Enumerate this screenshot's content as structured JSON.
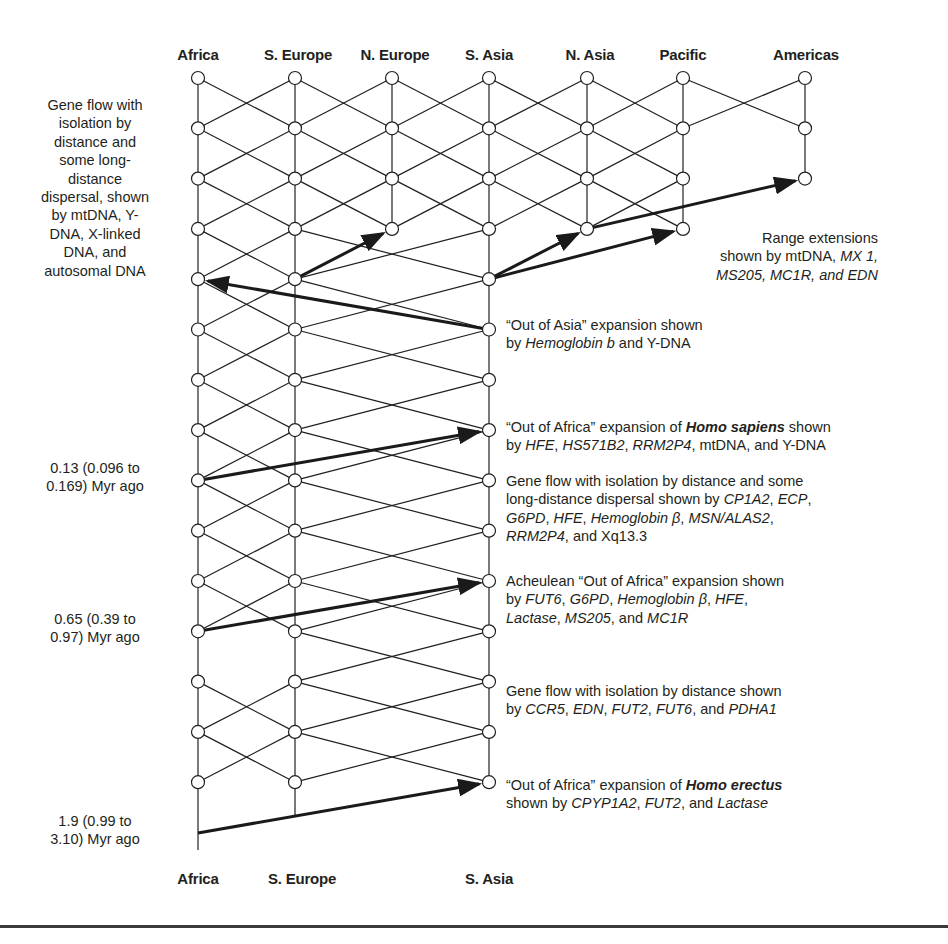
{
  "layout": {
    "columns": {
      "Africa": 198,
      "S. Europe": 295,
      "N. Europe": 392,
      "S. Asia": 489,
      "N. Asia": 587,
      "Pacific": 683,
      "Americas": 805
    },
    "row_y0": 78,
    "row_step": 50.3,
    "node_radius": 6.5,
    "line_color": "#231f20",
    "arrow_color": "#1a1a1a"
  },
  "header": {
    "regions": [
      {
        "name": "Africa",
        "x": 198
      },
      {
        "name": "S. Europe",
        "x": 298
      },
      {
        "name": "N. Europe",
        "x": 395
      },
      {
        "name": "S. Asia",
        "x": 489
      },
      {
        "name": "N. Asia",
        "x": 590
      },
      {
        "name": "Pacific",
        "x": 683
      },
      {
        "name": "Americas",
        "x": 806
      }
    ]
  },
  "footer": {
    "regions": [
      {
        "name": "Africa",
        "x": 198
      },
      {
        "name": "S. Europe",
        "x": 302
      },
      {
        "name": "S. Asia",
        "x": 489
      }
    ]
  },
  "left_notes": [
    {
      "id": "gene-flow-note",
      "top": 96,
      "lines": [
        "Gene flow with",
        "isolation by",
        "distance and",
        "some long-",
        "distance",
        "dispersal, shown",
        "by mtDNA, Y-",
        "DNA, X-linked",
        "DNA, and",
        "autosomal DNA"
      ]
    },
    {
      "id": "date-013",
      "top": 459,
      "lines": [
        "0.13 (0.096 to",
        "0.169) Myr ago"
      ]
    },
    {
      "id": "date-065",
      "top": 610,
      "lines": [
        "0.65 (0.39 to",
        "0.97) Myr ago"
      ]
    },
    {
      "id": "date-19",
      "top": 812,
      "lines": [
        "1.9 (0.99 to",
        "3.10) Myr ago"
      ]
    }
  ],
  "right_notes": [
    {
      "id": "range-extensions",
      "top": 229,
      "right": 878,
      "align": "right",
      "html_lines": [
        "Range extensions",
        "shown by mtDNA, <i>MX 1,</i>",
        "<i>MS205, MC1R, and EDN</i>"
      ]
    },
    {
      "id": "out-of-asia",
      "top": 316,
      "left": 506,
      "html_lines": [
        "“Out of Asia” expansion shown",
        "by <i>Hemoglobin b</i> and Y-DNA"
      ]
    },
    {
      "id": "out-of-africa-sapiens",
      "top": 418,
      "left": 506,
      "html_lines": [
        "“Out of Africa” expansion of <b>Homo sapiens</b> shown",
        "by <i>HFE</i>, <i>HS571B2</i>, <i>RRM2P4</i>, mtDNA, and Y-DNA"
      ]
    },
    {
      "id": "gene-flow-long-distance",
      "top": 472,
      "left": 506,
      "html_lines": [
        "Gene flow with isolation by distance and some",
        "long-distance dispersal shown by <i>CP1A2</i>, <i>ECP</i>,",
        "<i>G6PD</i>, <i>HFE</i>, <i>Hemoglobin β</i>, <i>MSN/ALAS2</i>,",
        "<i>RRM2P4</i>, and Xq13.3"
      ]
    },
    {
      "id": "acheulean",
      "top": 572,
      "left": 506,
      "html_lines": [
        "Acheulean “Out of Africa” expansion shown",
        "by <i>FUT6</i>, <i>G6PD</i>, <i>Hemoglobin β</i>, <i>HFE</i>,",
        "<i>Lactase</i>, <i>MS205</i>, and <i>MC1R</i>"
      ]
    },
    {
      "id": "gene-flow-isolation",
      "top": 682,
      "left": 506,
      "html_lines": [
        "Gene flow with isolation by distance shown",
        "by <i>CCR5</i>, <i>EDN</i>, <i>FUT2</i>, <i>FUT6</i>, and <i>PDHA1</i>"
      ]
    },
    {
      "id": "out-of-africa-erectus",
      "top": 776,
      "left": 506,
      "html_lines": [
        "“Out of Africa” expansion of <b>Homo erectus</b>",
        "shown by <i>CPYP1A2</i>, <i>FUT2</i>, and <i>Lactase</i>"
      ]
    }
  ],
  "chart_data": {
    "type": "network-diagram",
    "title": "",
    "regions": [
      "Africa",
      "S. Europe",
      "N. Europe",
      "S. Asia",
      "N. Asia",
      "Pacific",
      "Americas"
    ],
    "time_axis": "top = present, bottom = past",
    "nodes": {
      "Africa": [
        0,
        1,
        2,
        3,
        4,
        5,
        6,
        7,
        8,
        9,
        10,
        11,
        12,
        13,
        14
      ],
      "S. Europe": [
        0,
        1,
        2,
        3,
        4,
        5,
        6,
        7,
        8,
        9,
        10,
        11,
        12,
        13,
        14
      ],
      "N. Europe": [
        0,
        1,
        2,
        3
      ],
      "S. Asia": [
        0,
        1,
        2,
        3,
        4,
        5,
        6,
        7,
        8,
        9,
        10,
        11,
        12,
        13,
        14
      ],
      "N. Asia": [
        0,
        1,
        2,
        3
      ],
      "Pacific": [
        0,
        1,
        2,
        3
      ],
      "Americas": [
        0,
        1,
        2
      ]
    },
    "vertical_lines": [
      {
        "col": "Africa",
        "from_y": 78,
        "to_y": 850
      },
      {
        "col": "S. Europe",
        "from_y": 78,
        "to_y": 817
      },
      {
        "col": "N. Europe",
        "from_y": 78,
        "to_y": 229
      },
      {
        "col": "S. Asia",
        "from_y": 78,
        "to_y": 782
      },
      {
        "col": "N. Asia",
        "from_y": 78,
        "to_y": 229
      },
      {
        "col": "Pacific",
        "from_y": 78,
        "to_y": 229
      },
      {
        "col": "Americas",
        "from_y": 78,
        "to_y": 179
      }
    ],
    "crossing_pairs": [
      {
        "a": "Africa",
        "b": "S. Europe",
        "rows": [
          0,
          1,
          2,
          3,
          4,
          5,
          6,
          7,
          8,
          9,
          10,
          12,
          13
        ]
      },
      {
        "a": "S. Europe",
        "b": "N. Europe",
        "rows": [
          0,
          1,
          2
        ]
      },
      {
        "a": "N. Europe",
        "b": "S. Asia",
        "rows": [
          0,
          1,
          2
        ]
      },
      {
        "a": "S. Europe",
        "b": "S. Asia",
        "rows": [
          3,
          4,
          5,
          6,
          7,
          8,
          9,
          10,
          11,
          12,
          13
        ]
      },
      {
        "a": "S. Asia",
        "b": "N. Asia",
        "rows": [
          0,
          1,
          2
        ]
      },
      {
        "a": "N. Asia",
        "b": "Pacific",
        "rows": [
          0,
          1,
          2
        ]
      },
      {
        "a": "Pacific",
        "b": "Americas",
        "rows": [
          0
        ]
      }
    ],
    "arrows": [
      {
        "label": "Range extension to N. Europe",
        "from": [
          "S. Europe",
          4
        ],
        "to": [
          "N. Europe",
          3
        ]
      },
      {
        "label": "Range extension to N. Asia",
        "from": [
          "S. Asia",
          4
        ],
        "to": [
          "N. Asia",
          3
        ]
      },
      {
        "label": "Range extension to Pacific",
        "from": [
          "S. Asia",
          4
        ],
        "to": [
          "Pacific",
          3
        ]
      },
      {
        "label": "Range extension to Americas",
        "from": [
          "N. Asia",
          3
        ],
        "to": [
          "Americas",
          2
        ]
      },
      {
        "label": "Out of Asia",
        "from": [
          "S. Asia",
          5
        ],
        "to": [
          "Africa",
          4
        ]
      },
      {
        "label": "Out of Africa (Homo sapiens)",
        "from": [
          "Africa",
          8
        ],
        "to": [
          "S. Asia",
          7
        ]
      },
      {
        "label": "Acheulean Out of Africa",
        "from": [
          "Africa",
          11
        ],
        "to": [
          "S. Asia",
          10
        ]
      },
      {
        "label": "Out of Africa (Homo erectus)",
        "from_xy": [
          198,
          833
        ],
        "to": [
          "S. Asia",
          14
        ]
      }
    ],
    "time_labels": [
      {
        "text": "0.13 (0.096 to 0.169) Myr ago",
        "row": 8
      },
      {
        "text": "0.65 (0.39 to 0.97) Myr ago",
        "row": 11
      },
      {
        "text": "1.9 (0.99 to 3.10) Myr ago",
        "row": "base"
      }
    ]
  }
}
